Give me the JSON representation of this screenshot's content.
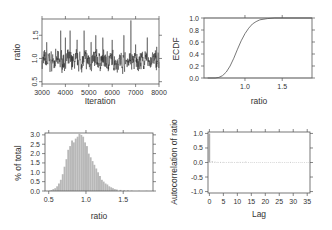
{
  "chart_data": [
    {
      "type": "line",
      "panel": "trace",
      "title": "",
      "xlabel": "Iteration",
      "ylabel": "ratio",
      "xlim": [
        3000,
        8000
      ],
      "ylim": [
        0.45,
        1.85
      ],
      "xticks": [
        3000,
        4000,
        5000,
        6000,
        7000,
        8000
      ],
      "yticks": [
        0.5,
        1.0,
        1.5
      ],
      "grid": false,
      "series": [
        {
          "name": "ratio",
          "description": "MCMC trace fluctuating around ~0.95 with spikes up to ~1.8 near iteration 6800"
        }
      ],
      "spikes": [
        {
          "x": 3200,
          "y": 1.35
        },
        {
          "x": 3800,
          "y": 1.6
        },
        {
          "x": 4000,
          "y": 1.45
        },
        {
          "x": 4200,
          "y": 1.6
        },
        {
          "x": 4500,
          "y": 1.4
        },
        {
          "x": 4800,
          "y": 1.6
        },
        {
          "x": 5100,
          "y": 1.35
        },
        {
          "x": 5300,
          "y": 1.5
        },
        {
          "x": 5600,
          "y": 1.45
        },
        {
          "x": 6000,
          "y": 1.4
        },
        {
          "x": 6500,
          "y": 1.5
        },
        {
          "x": 6800,
          "y": 1.82
        },
        {
          "x": 7000,
          "y": 1.3
        },
        {
          "x": 7500,
          "y": 1.45
        },
        {
          "x": 7900,
          "y": 1.25
        }
      ]
    },
    {
      "type": "line",
      "panel": "ecdf",
      "xlabel": "ratio",
      "ylabel": "ECDF",
      "xlim": [
        0.45,
        1.9
      ],
      "ylim": [
        0.0,
        1.0
      ],
      "xticks": [
        1.0,
        1.5
      ],
      "yticks": [
        0.0,
        0.2,
        0.4,
        0.6,
        0.8,
        1.0
      ],
      "grid": false,
      "x": [
        0.5,
        0.6,
        0.65,
        0.7,
        0.75,
        0.8,
        0.85,
        0.9,
        0.95,
        1.0,
        1.05,
        1.1,
        1.15,
        1.2,
        1.3,
        1.4,
        1.5,
        1.9
      ],
      "y": [
        0.0,
        0.0,
        0.01,
        0.04,
        0.1,
        0.2,
        0.33,
        0.48,
        0.62,
        0.74,
        0.83,
        0.9,
        0.94,
        0.97,
        0.99,
        1.0,
        1.0,
        1.0
      ]
    },
    {
      "type": "bar",
      "panel": "histogram",
      "xlabel": "ratio",
      "ylabel": "% of total",
      "xlim": [
        0.45,
        1.9
      ],
      "ylim": [
        0.0,
        3.1
      ],
      "xticks": [
        0.5,
        1.0,
        1.5
      ],
      "yticks": [
        0.0,
        0.5,
        1.0,
        1.5,
        2.0,
        2.5,
        3.0
      ],
      "grid": false,
      "bin_width": 0.025,
      "categories": [
        0.5,
        0.525,
        0.55,
        0.575,
        0.6,
        0.625,
        0.65,
        0.675,
        0.7,
        0.725,
        0.75,
        0.775,
        0.8,
        0.825,
        0.85,
        0.875,
        0.9,
        0.925,
        0.95,
        0.975,
        1.0,
        1.025,
        1.05,
        1.075,
        1.1,
        1.125,
        1.15,
        1.175,
        1.2,
        1.225,
        1.25,
        1.275,
        1.3,
        1.325,
        1.35,
        1.375,
        1.4,
        1.45,
        1.5,
        1.55,
        1.6,
        1.7,
        1.8
      ],
      "values": [
        0.02,
        0.05,
        0.1,
        0.15,
        0.25,
        0.4,
        0.6,
        0.9,
        1.3,
        1.7,
        2.2,
        2.4,
        2.7,
        2.6,
        2.8,
        2.9,
        3.05,
        3.0,
        2.9,
        2.6,
        2.4,
        2.0,
        1.8,
        1.6,
        1.4,
        1.2,
        1.0,
        0.8,
        0.6,
        0.5,
        0.4,
        0.35,
        0.25,
        0.2,
        0.15,
        0.1,
        0.08,
        0.06,
        0.04,
        0.03,
        0.02,
        0.01,
        0.01
      ]
    },
    {
      "type": "bar",
      "panel": "acf",
      "xlabel": "Lag",
      "ylabel": "Autocorrelation of ratio",
      "xlim": [
        -0.5,
        36
      ],
      "ylim": [
        -1.05,
        1.05
      ],
      "xticks": [
        0,
        5,
        10,
        15,
        20,
        25,
        30,
        35
      ],
      "yticks": [
        -1.0,
        -0.5,
        0.0,
        0.5,
        1.0
      ],
      "grid": false,
      "categories": [
        0,
        1,
        2,
        3,
        4,
        5,
        6,
        7,
        8,
        9,
        10,
        11,
        12,
        13,
        14,
        15,
        16,
        17,
        18,
        19,
        20,
        21,
        22,
        23,
        24,
        25,
        26,
        27,
        28,
        29,
        30,
        31,
        32,
        33,
        34,
        35
      ],
      "values": [
        1.0,
        0.05,
        0.03,
        0.02,
        0.02,
        0.02,
        0.01,
        0.02,
        0.02,
        0.01,
        0.02,
        0.02,
        0.02,
        0.03,
        0.01,
        0.01,
        0.01,
        0.01,
        0.01,
        0.01,
        0.01,
        0.01,
        0.01,
        0.01,
        0.01,
        0.02,
        0.01,
        0.01,
        0.01,
        0.02,
        0.01,
        0.01,
        0.01,
        0.01,
        0.01,
        0.01
      ]
    }
  ],
  "labels": {
    "trace": {
      "xlabel": "Iteration",
      "ylabel": "ratio",
      "xticks": [
        "3000",
        "4000",
        "5000",
        "6000",
        "7000",
        "8000"
      ],
      "yticks": [
        "0.5",
        "1.0",
        "1.5"
      ]
    },
    "ecdf": {
      "xlabel": "ratio",
      "ylabel": "ECDF",
      "xticks": [
        "1.0",
        "1.5"
      ],
      "yticks": [
        "0.0",
        "0.2",
        "0.4",
        "0.6",
        "0.8",
        "1.0"
      ]
    },
    "hist": {
      "xlabel": "ratio",
      "ylabel": "% of total",
      "xticks": [
        "0.5",
        "1.0",
        "1.5"
      ],
      "yticks": [
        "0.0",
        "0.5",
        "1.0",
        "1.5",
        "2.0",
        "2.5",
        "3.0"
      ]
    },
    "acf": {
      "xlabel": "Lag",
      "ylabel": "Autocorrelation of ratio",
      "xticks": [
        "0",
        "5",
        "10",
        "15",
        "20",
        "25",
        "30",
        "35"
      ],
      "yticks": [
        "-1.0",
        "-0.5",
        "0.0",
        "0.5",
        "1.0"
      ]
    }
  },
  "colors": {
    "trace_line": "#222222",
    "ecdf_line": "#555555",
    "hist_fill": "#b8b8b8",
    "acf_bar": "#aaaaaa",
    "axis": "#555555",
    "text": "#333333"
  }
}
